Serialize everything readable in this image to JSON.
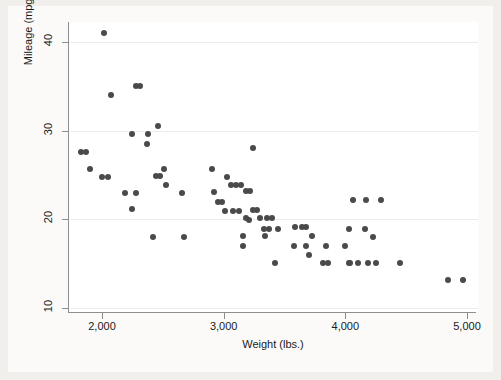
{
  "chart_data": {
    "type": "scatter",
    "title": "",
    "xlabel": "Weight (lbs.)",
    "ylabel": "Mileage (mpg)",
    "xlim": [
      1700,
      5000
    ],
    "ylim": [
      9,
      42
    ],
    "xticks": [
      2000,
      3000,
      4000,
      5000
    ],
    "xticklabels": [
      "2,000",
      "3,000",
      "4,000",
      "5,000"
    ],
    "yticks": [
      10,
      20,
      30,
      40
    ],
    "yticklabels": [
      "10",
      "20",
      "30",
      "40"
    ],
    "grid": "horizontal",
    "legend": "none",
    "marker_color": "#4a4a4a",
    "marker_size": 6,
    "background_color": "#fbfaf9",
    "plot_background_color": "#ffffff",
    "axis_color": "#8e8e8e",
    "points": [
      {
        "x": 2020,
        "y": 41.0
      },
      {
        "x": 2280,
        "y": 35.0
      },
      {
        "x": 2310,
        "y": 35.0
      },
      {
        "x": 2070,
        "y": 34.0
      },
      {
        "x": 2460,
        "y": 30.5
      },
      {
        "x": 2250,
        "y": 29.6
      },
      {
        "x": 2380,
        "y": 29.6
      },
      {
        "x": 2370,
        "y": 28.5
      },
      {
        "x": 1830,
        "y": 27.6
      },
      {
        "x": 1865,
        "y": 27.6
      },
      {
        "x": 1900,
        "y": 25.7
      },
      {
        "x": 2000,
        "y": 24.8
      },
      {
        "x": 2050,
        "y": 24.8
      },
      {
        "x": 2510,
        "y": 25.7
      },
      {
        "x": 2440,
        "y": 24.9
      },
      {
        "x": 2480,
        "y": 24.9
      },
      {
        "x": 2530,
        "y": 23.9
      },
      {
        "x": 2190,
        "y": 23.0
      },
      {
        "x": 2280,
        "y": 23.0
      },
      {
        "x": 2660,
        "y": 23.0
      },
      {
        "x": 2250,
        "y": 21.2
      },
      {
        "x": 2900,
        "y": 25.7
      },
      {
        "x": 3030,
        "y": 24.8
      },
      {
        "x": 3060,
        "y": 23.9
      },
      {
        "x": 3100,
        "y": 23.9
      },
      {
        "x": 3140,
        "y": 23.9
      },
      {
        "x": 2950,
        "y": 21.9
      },
      {
        "x": 2990,
        "y": 21.9
      },
      {
        "x": 3010,
        "y": 20.9
      },
      {
        "x": 3080,
        "y": 20.9
      },
      {
        "x": 3130,
        "y": 20.9
      },
      {
        "x": 3210,
        "y": 19.9
      },
      {
        "x": 2420,
        "y": 18.0
      },
      {
        "x": 2670,
        "y": 18.0
      },
      {
        "x": 3160,
        "y": 17.0
      },
      {
        "x": 3240,
        "y": 28.0
      },
      {
        "x": 2920,
        "y": 23.1
      },
      {
        "x": 3180,
        "y": 23.2
      },
      {
        "x": 3220,
        "y": 23.2
      },
      {
        "x": 4170,
        "y": 22.2
      },
      {
        "x": 3240,
        "y": 21.0
      },
      {
        "x": 3270,
        "y": 21.0
      },
      {
        "x": 3180,
        "y": 20.1
      },
      {
        "x": 3300,
        "y": 20.1
      },
      {
        "x": 3360,
        "y": 20.1
      },
      {
        "x": 3400,
        "y": 20.1
      },
      {
        "x": 3330,
        "y": 18.9
      },
      {
        "x": 3370,
        "y": 18.9
      },
      {
        "x": 3450,
        "y": 18.9
      },
      {
        "x": 3590,
        "y": 19.1
      },
      {
        "x": 3640,
        "y": 19.1
      },
      {
        "x": 3680,
        "y": 19.1
      },
      {
        "x": 3160,
        "y": 18.1
      },
      {
        "x": 3340,
        "y": 18.1
      },
      {
        "x": 3730,
        "y": 18.1
      },
      {
        "x": 3580,
        "y": 17.0
      },
      {
        "x": 3680,
        "y": 17.0
      },
      {
        "x": 3840,
        "y": 17.0
      },
      {
        "x": 4000,
        "y": 17.0
      },
      {
        "x": 3700,
        "y": 16.0
      },
      {
        "x": 3420,
        "y": 15.1
      },
      {
        "x": 3820,
        "y": 15.1
      },
      {
        "x": 3860,
        "y": 15.1
      },
      {
        "x": 4030,
        "y": 15.1
      },
      {
        "x": 4100,
        "y": 15.1
      },
      {
        "x": 4060,
        "y": 22.2
      },
      {
        "x": 4290,
        "y": 22.2
      },
      {
        "x": 4030,
        "y": 18.9
      },
      {
        "x": 4160,
        "y": 18.9
      },
      {
        "x": 4230,
        "y": 18.0
      },
      {
        "x": 4040,
        "y": 15.1
      },
      {
        "x": 4190,
        "y": 15.1
      },
      {
        "x": 4250,
        "y": 15.1
      },
      {
        "x": 4450,
        "y": 15.1
      },
      {
        "x": 4840,
        "y": 13.2
      },
      {
        "x": 4970,
        "y": 13.2
      }
    ]
  }
}
